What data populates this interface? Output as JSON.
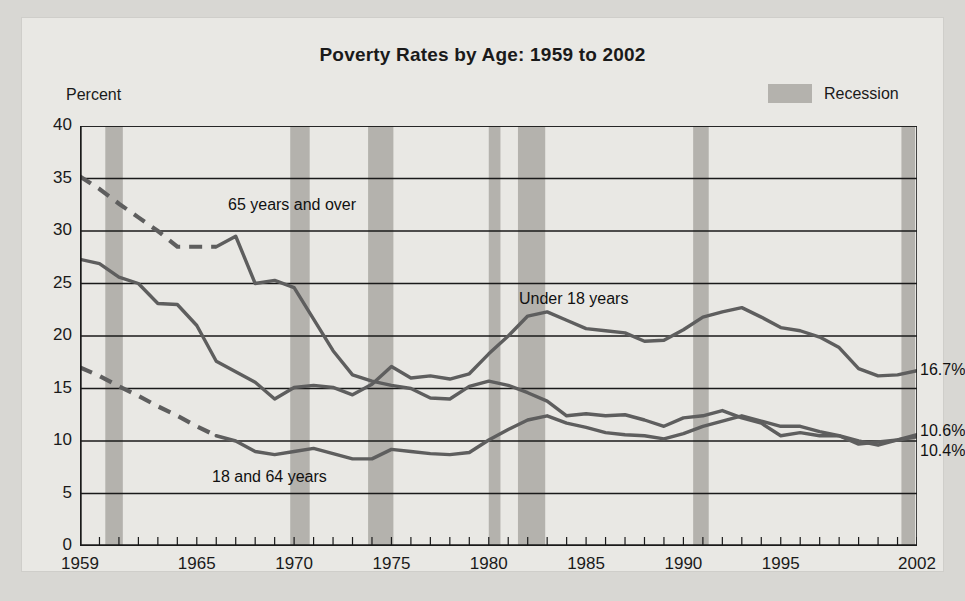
{
  "figure": {
    "title": "Poverty Rates by Age: 1959 to 2002",
    "y_axis_title": "Percent",
    "background": "#e9e8e4",
    "line_color": "#5e5e5e",
    "recession_color": "#b4b2ad"
  },
  "legend": {
    "items": [
      {
        "label": "Recession",
        "swatch_color": "#b4b2ad"
      }
    ]
  },
  "annotations": [
    {
      "id": "over65",
      "text": "65 years and over",
      "x": 206,
      "y": 178
    },
    {
      "id": "under18",
      "text": "Under 18 years",
      "x": 497,
      "y": 272
    },
    {
      "id": "age18to64",
      "text": "18 and 64 years",
      "x": 190,
      "y": 450
    }
  ],
  "end_labels": [
    {
      "id": "under18-end",
      "text": "16.7%",
      "x": 898,
      "y": 343
    },
    {
      "id": "over65-end",
      "text": "10.6%",
      "x": 898,
      "y": 404
    },
    {
      "id": "age18to64-end",
      "text": "10.4%",
      "x": 898,
      "y": 424
    }
  ],
  "chart_data": {
    "type": "line",
    "title": "Poverty Rates by Age: 1959 to 2002",
    "xlabel": "",
    "ylabel": "Percent",
    "xlim": [
      1959,
      2002
    ],
    "ylim": [
      0,
      40
    ],
    "yticks": [
      0,
      5,
      10,
      15,
      20,
      25,
      30,
      35,
      40
    ],
    "xticks": [
      1959,
      1965,
      1970,
      1975,
      1980,
      1985,
      1990,
      1995,
      2002
    ],
    "xtick_minor_step": 1,
    "grid": "horizontal",
    "legend_position": "top-right",
    "shaded_regions": {
      "label": "Recession",
      "color": "#b4b2ad",
      "spans": [
        [
          1960.3,
          1961.2
        ],
        [
          1969.8,
          1970.8
        ],
        [
          1973.8,
          1975.1
        ],
        [
          1980.0,
          1980.6
        ],
        [
          1981.5,
          1982.9
        ],
        [
          1990.5,
          1991.3
        ],
        [
          2001.2,
          2001.9
        ]
      ]
    },
    "series": [
      {
        "name": "65 years and over",
        "color": "#5e5e5e",
        "dashed_segment_years": [
          1959,
          1966
        ],
        "end_label": "10.6%",
        "x": [
          1959,
          1960,
          1961,
          1962,
          1963,
          1964,
          1965,
          1966,
          1967,
          1968,
          1969,
          1970,
          1971,
          1972,
          1973,
          1974,
          1975,
          1976,
          1977,
          1978,
          1979,
          1980,
          1981,
          1982,
          1983,
          1984,
          1985,
          1986,
          1987,
          1988,
          1989,
          1990,
          1991,
          1992,
          1993,
          1994,
          1995,
          1996,
          1997,
          1998,
          1999,
          2000,
          2001,
          2002
        ],
        "values": [
          35.2,
          34.0,
          32.6,
          31.3,
          30.0,
          28.5,
          28.5,
          28.5,
          29.5,
          25.0,
          25.3,
          24.6,
          21.6,
          18.6,
          16.3,
          15.7,
          15.3,
          15.0,
          14.1,
          14.0,
          15.2,
          15.7,
          15.3,
          14.6,
          13.8,
          12.4,
          12.6,
          12.4,
          12.5,
          12.0,
          11.4,
          12.2,
          12.4,
          12.9,
          12.2,
          11.7,
          10.5,
          10.8,
          10.5,
          10.5,
          9.7,
          9.9,
          10.1,
          10.6
        ]
      },
      {
        "name": "Under 18 years",
        "color": "#5e5e5e",
        "dashed_segment_years": [],
        "end_label": "16.7%",
        "x": [
          1959,
          1960,
          1961,
          1962,
          1963,
          1964,
          1965,
          1966,
          1967,
          1968,
          1969,
          1970,
          1971,
          1972,
          1973,
          1974,
          1975,
          1976,
          1977,
          1978,
          1979,
          1980,
          1981,
          1982,
          1983,
          1984,
          1985,
          1986,
          1987,
          1988,
          1989,
          1990,
          1991,
          1992,
          1993,
          1994,
          1995,
          1996,
          1997,
          1998,
          1999,
          2000,
          2001,
          2002
        ],
        "values": [
          27.3,
          26.9,
          25.6,
          25.0,
          23.1,
          23.0,
          21.0,
          17.6,
          16.6,
          15.6,
          14.0,
          15.1,
          15.3,
          15.1,
          14.4,
          15.4,
          17.1,
          16.0,
          16.2,
          15.9,
          16.4,
          18.3,
          20.0,
          21.9,
          22.3,
          21.5,
          20.7,
          20.5,
          20.3,
          19.5,
          19.6,
          20.6,
          21.8,
          22.3,
          22.7,
          21.8,
          20.8,
          20.5,
          19.9,
          18.9,
          16.9,
          16.2,
          16.3,
          16.7
        ]
      },
      {
        "name": "18 and 64 years",
        "color": "#5e5e5e",
        "dashed_segment_years": [
          1959,
          1966
        ],
        "end_label": "10.4%",
        "x": [
          1959,
          1960,
          1961,
          1962,
          1963,
          1964,
          1965,
          1966,
          1967,
          1968,
          1969,
          1970,
          1971,
          1972,
          1973,
          1974,
          1975,
          1976,
          1977,
          1978,
          1979,
          1980,
          1981,
          1982,
          1983,
          1984,
          1985,
          1986,
          1987,
          1988,
          1989,
          1990,
          1991,
          1992,
          1993,
          1994,
          1995,
          1996,
          1997,
          1998,
          1999,
          2000,
          2001,
          2002
        ],
        "values": [
          17.0,
          16.2,
          15.2,
          14.3,
          13.3,
          12.4,
          11.4,
          10.5,
          10.0,
          9.0,
          8.7,
          9.0,
          9.3,
          8.8,
          8.3,
          8.3,
          9.2,
          9.0,
          8.8,
          8.7,
          8.9,
          10.1,
          11.1,
          12.0,
          12.4,
          11.7,
          11.3,
          10.8,
          10.6,
          10.5,
          10.2,
          10.7,
          11.4,
          11.9,
          12.4,
          11.9,
          11.4,
          11.4,
          10.9,
          10.5,
          10.0,
          9.6,
          10.1,
          10.4
        ]
      }
    ]
  }
}
